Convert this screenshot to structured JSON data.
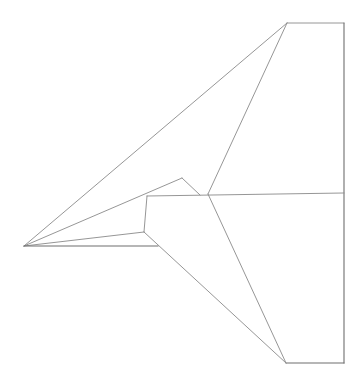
{
  "figure": {
    "stroke_color": "#8a8a8a",
    "stroke_color_dark": "#6e6e6e",
    "background": "#ffffff"
  },
  "points": {
    "nose": [
      24,
      246
    ],
    "wing_top_left": [
      287,
      23
    ],
    "wing_top_right": [
      344,
      23
    ],
    "wing_bottom_right": [
      344,
      363
    ],
    "wing_bottom_left": [
      286,
      363
    ],
    "center_fold": [
      208,
      194
    ],
    "center_right": [
      344,
      193
    ],
    "body_top_left": [
      147,
      196
    ],
    "peak": [
      182,
      178
    ],
    "peak_return": [
      200,
      195
    ],
    "body_corner": [
      144,
      232
    ],
    "keel_end": [
      158,
      246
    ]
  },
  "segments": [
    {
      "name": "top-wing-leading-edge",
      "from": "nose",
      "to": "wing_top_left"
    },
    {
      "name": "top-wing-tip-edge",
      "from": "wing_top_left",
      "to": "wing_top_right"
    },
    {
      "name": "trailing-edge",
      "from": "wing_top_right",
      "to": "wing_bottom_right"
    },
    {
      "name": "bottom-wing-tip-edge",
      "from": "wing_bottom_left",
      "to": "wing_bottom_right"
    },
    {
      "name": "top-wing-fold",
      "from": "wing_top_left",
      "to": "center_fold"
    },
    {
      "name": "bottom-wing-fold",
      "from": "center_fold",
      "to": "wing_bottom_left"
    },
    {
      "name": "center-crease",
      "from": "body_top_left",
      "to": "center_right"
    },
    {
      "name": "nose-to-peak",
      "from": "nose",
      "to": "peak"
    },
    {
      "name": "peak-to-crease",
      "from": "peak",
      "to": "peak_return"
    },
    {
      "name": "body-front-edge",
      "from": "body_top_left",
      "to": "body_corner"
    },
    {
      "name": "nose-to-body-corner",
      "from": "nose",
      "to": "body_corner"
    },
    {
      "name": "body-corner-to-wing-bottom",
      "from": "body_corner",
      "to": "wing_bottom_left"
    },
    {
      "name": "keel-line",
      "from": "nose",
      "to": "keel_end"
    }
  ]
}
